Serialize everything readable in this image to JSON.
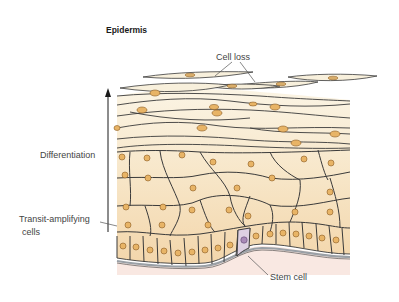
{
  "figure": {
    "title": "Epidermis",
    "labels": {
      "cell_loss": "Cell loss",
      "differentiation": "Differentiation",
      "transit_amplifying_line1": "Transit-amplifying",
      "transit_amplifying_line2": "cells",
      "stem_cell": "Stem cell"
    },
    "colors": {
      "cell_fill_light": "#f8f0dc",
      "cell_fill_mid": "#f6e3c2",
      "cell_fill_basal": "#f4d9b0",
      "nucleus_fill": "#e8b466",
      "nucleus_stroke": "#8a5a22",
      "stem_cell_fill": "#ddd0e2",
      "stem_nucleus_fill": "#a98ab8",
      "dermis_fill": "#f9e8e2",
      "basement_membrane": "#9aa0a6",
      "cell_outline": "#3a3a3a"
    }
  }
}
